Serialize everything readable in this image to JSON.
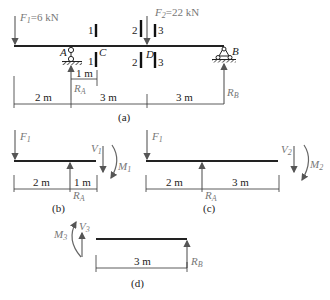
{
  "figure_a": {
    "caption": "(a)",
    "F1_label": "F",
    "F1_sub": "1",
    "F1_value": "=6 kN",
    "F2_label": "F",
    "F2_sub": "2",
    "F2_value": "=22 kN",
    "support_A": "A",
    "support_B": "B",
    "point_C": "C",
    "point_D": "D",
    "RA_label": "R",
    "RA_sub": "A",
    "RB_label": "R",
    "RB_sub": "B",
    "section_1": "1",
    "section_2": "2",
    "section_3": "3",
    "dim_AC": "1 m",
    "dims": [
      "2 m",
      "3 m",
      "3 m"
    ]
  },
  "figure_b": {
    "caption": "(b)",
    "F1_label": "F",
    "F1_sub": "1",
    "V_label": "V",
    "V_sub": "1",
    "M_label": "M",
    "M_sub": "1",
    "RA_label": "R",
    "RA_sub": "A",
    "dims": [
      "2 m",
      "1 m"
    ]
  },
  "figure_c": {
    "caption": "(c)",
    "F1_label": "F",
    "F1_sub": "1",
    "V_label": "V",
    "V_sub": "2",
    "M_label": "M",
    "M_sub": "2",
    "RA_label": "R",
    "RA_sub": "A",
    "dims": [
      "2 m",
      "3 m"
    ]
  },
  "figure_d": {
    "caption": "(d)",
    "V_label": "V",
    "V_sub": "3",
    "M_label": "M",
    "M_sub": "3",
    "RB_label": "R",
    "RB_sub": "B",
    "dims": [
      "3 m"
    ]
  }
}
